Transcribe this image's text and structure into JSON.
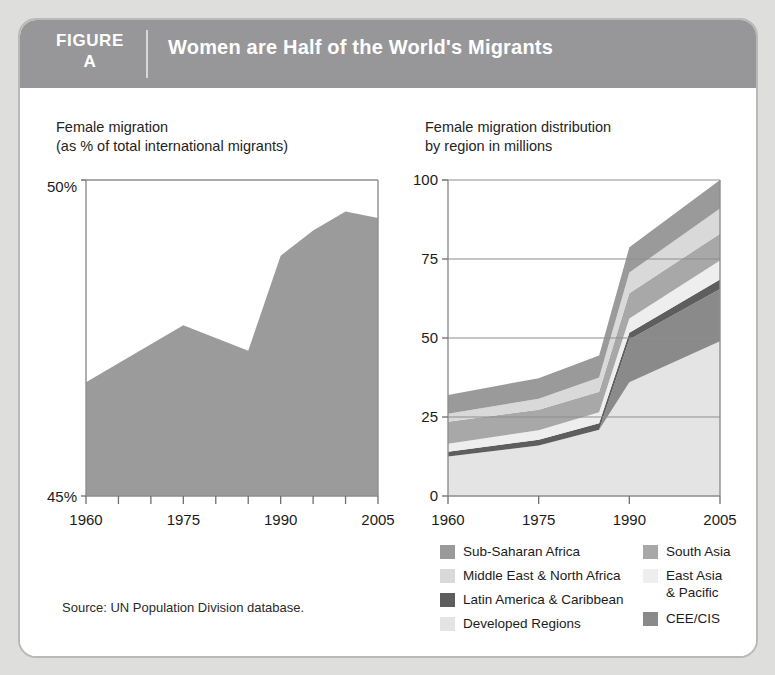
{
  "figure": {
    "label_word": "FIGURE",
    "label_letter": "A",
    "title": "Women are Half of the World's Migrants",
    "header_bg": "#97979a",
    "card_bg": "#ffffff",
    "page_bg": "#dededc"
  },
  "source": {
    "note": "Source: UN Population Division database."
  },
  "left_panel": {
    "title": "Female migration\n(as % of total international migrants)"
  },
  "right_panel": {
    "title": "Female migration distribution\nby region in millions"
  },
  "legend": {
    "left_column": [
      {
        "label": "Sub-Saharan Africa",
        "color": "#9a9a9a"
      },
      {
        "label": "Middle East & North Africa",
        "color": "#d9d9d9"
      },
      {
        "label": "Latin America & Caribbean",
        "color": "#5e5e5e"
      },
      {
        "label": "Developed Regions",
        "color": "#e4e4e4"
      }
    ],
    "right_column": [
      {
        "label": "South Asia",
        "color": "#a8a8a8"
      },
      {
        "label": "East Asia\n    & Pacific",
        "color": "#eeeeee"
      },
      {
        "label": "CEE/CIS",
        "color": "#8a8a8a"
      }
    ]
  },
  "chart_data": [
    {
      "id": "female-migration-share",
      "type": "area",
      "title": "Female migration\n(as % of total international migrants)",
      "xlabel": "",
      "ylabel": "",
      "ylim": [
        45,
        50
      ],
      "ytick_labels": [
        "45%",
        "50%"
      ],
      "ytick_values": [
        45,
        50
      ],
      "xlim": [
        1960,
        2005
      ],
      "xtick_labels": [
        "1960",
        "1975",
        "1990",
        "2005"
      ],
      "xtick_values": [
        1960,
        1975,
        1990,
        2005
      ],
      "minor_xticks": [
        1965,
        1970,
        1980,
        1985,
        1995,
        2000
      ],
      "grid": false,
      "fill_color": "#9b9b9b",
      "x": [
        1960,
        1965,
        1970,
        1975,
        1980,
        1985,
        1990,
        1995,
        2000,
        2005
      ],
      "values": [
        46.8,
        47.1,
        47.4,
        47.7,
        47.5,
        47.3,
        48.8,
        49.2,
        49.5,
        49.4
      ]
    },
    {
      "id": "female-migration-by-region",
      "type": "area",
      "stacked": true,
      "title": "Female migration distribution\nby region in millions",
      "xlabel": "",
      "ylabel": "",
      "ylim": [
        0,
        100
      ],
      "ytick_labels": [
        "0",
        "25",
        "50",
        "75",
        "100"
      ],
      "ytick_values": [
        0,
        25,
        50,
        75,
        100
      ],
      "xlim": [
        1960,
        2005
      ],
      "xtick_labels": [
        "1960",
        "1975",
        "1990",
        "2005"
      ],
      "xtick_values": [
        1960,
        1975,
        1990,
        2005
      ],
      "grid": true,
      "x": [
        1960,
        1975,
        1985,
        1990,
        2005
      ],
      "series": [
        {
          "name": "Developed Regions",
          "color": "#e4e4e4",
          "values": [
            12.5,
            16.0,
            21.0,
            36.0,
            49.0
          ]
        },
        {
          "name": "CEE/CIS",
          "color": "#8a8a8a",
          "values": [
            0.0,
            0.0,
            0.0,
            13.5,
            16.5
          ]
        },
        {
          "name": "Latin America & Caribbean",
          "color": "#5e5e5e",
          "values": [
            1.5,
            1.8,
            2.0,
            2.2,
            3.0
          ]
        },
        {
          "name": "East Asia & Pacific",
          "color": "#eeeeee",
          "values": [
            2.5,
            3.0,
            3.5,
            4.5,
            6.0
          ]
        },
        {
          "name": "South Asia",
          "color": "#a8a8a8",
          "values": [
            7.0,
            6.5,
            6.5,
            8.0,
            8.5
          ]
        },
        {
          "name": "Middle East & North Africa",
          "color": "#d9d9d9",
          "values": [
            2.5,
            3.5,
            4.5,
            6.5,
            8.0
          ]
        },
        {
          "name": "Sub-Saharan Africa",
          "color": "#9a9a9a",
          "values": [
            6.0,
            6.5,
            7.0,
            8.0,
            9.0
          ]
        }
      ]
    }
  ]
}
